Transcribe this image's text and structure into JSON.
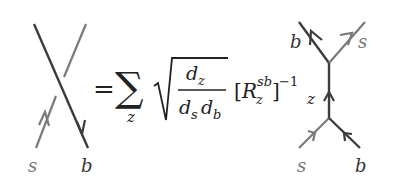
{
  "equation": {
    "left_diagram": {
      "bottom_left": "s",
      "bottom_right": "b",
      "description": "crossing: b strand over s strand"
    },
    "equals": "=",
    "sum_symbol": "∑",
    "sum_index": "z",
    "fraction_numerator": "d",
    "numerator_sub": "z",
    "fraction_denominator_1": "d",
    "denominator_sub_1": "s",
    "fraction_denominator_2": "d",
    "denominator_sub_2": "b",
    "bracket_open": "[",
    "R": "R",
    "R_sup": "sb",
    "R_sub": "z",
    "bracket_close": "]",
    "exponent": "−1",
    "trailing_sub": "z",
    "right_diagram": {
      "top_left": "b",
      "top_right": "s",
      "bottom_left": "s",
      "bottom_right": "b",
      "middle": "z"
    }
  },
  "colors": {
    "s_strand": "#7a7a7a",
    "b_strand": "#3c3c3c",
    "text": "#222222"
  }
}
